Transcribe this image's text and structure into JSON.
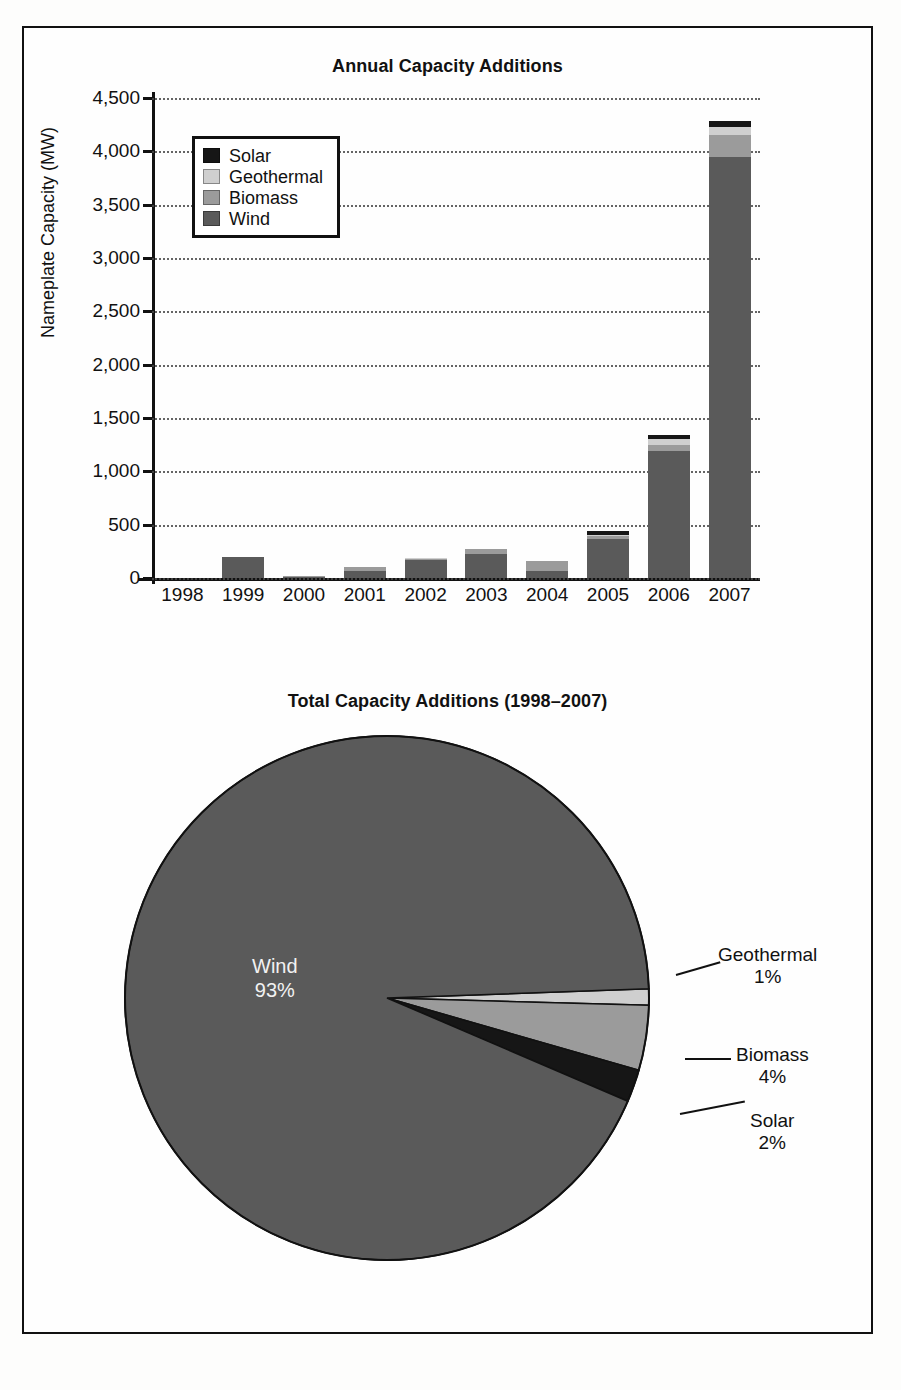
{
  "figure": {
    "background": "#fdfdfc",
    "border_color": "#111111"
  },
  "colors": {
    "solar": "#161616",
    "geothermal": "#cfcfcf",
    "biomass": "#9b9b9b",
    "wind": "#5a5a5a",
    "axis": "#111111",
    "grid": "#4a4a4a"
  },
  "bar_chart": {
    "title": "Annual Capacity Additions",
    "ylabel": "Nameplate Capacity (MW)",
    "legend": [
      {
        "label": "Solar",
        "color": "#161616"
      },
      {
        "label": "Geothermal",
        "color": "#cfcfcf"
      },
      {
        "label": "Biomass",
        "color": "#9b9b9b"
      },
      {
        "label": "Wind",
        "color": "#5a5a5a"
      }
    ],
    "yticks": [
      "4,500",
      "4,000",
      "3,500",
      "3,000",
      "2,500",
      "2,000",
      "1,500",
      "1,000",
      "500",
      "0"
    ]
  },
  "pie_chart": {
    "title": "Total Capacity Additions (1998–2007)",
    "callouts": [
      {
        "label": "Geothermal",
        "value": "1%"
      },
      {
        "label": "Biomass",
        "value": "4%"
      },
      {
        "label": "Solar",
        "value": "2%"
      },
      {
        "label": "Wind",
        "value": "93%"
      }
    ]
  },
  "chart_data": [
    {
      "type": "bar",
      "subtype": "stacked",
      "title": "Annual Capacity Additions",
      "xlabel": "",
      "ylabel": "Nameplate Capacity (MW)",
      "ylim": [
        0,
        4500
      ],
      "ytick_step": 500,
      "grid": true,
      "legend_position": "upper-left-inside",
      "categories": [
        "1998",
        "1999",
        "2000",
        "2001",
        "2002",
        "2003",
        "2004",
        "2005",
        "2006",
        "2007"
      ],
      "series": [
        {
          "name": "Wind",
          "color": "#5a5a5a",
          "values": [
            0,
            195,
            10,
            65,
            165,
            225,
            65,
            370,
            1190,
            3950
          ]
        },
        {
          "name": "Biomass",
          "color": "#9b9b9b",
          "values": [
            0,
            0,
            10,
            40,
            15,
            50,
            90,
            25,
            55,
            200
          ]
        },
        {
          "name": "Geothermal",
          "color": "#cfcfcf",
          "values": [
            0,
            0,
            0,
            0,
            5,
            0,
            0,
            10,
            55,
            80
          ]
        },
        {
          "name": "Solar",
          "color": "#161616",
          "values": [
            0,
            0,
            0,
            0,
            5,
            0,
            0,
            35,
            40,
            55
          ]
        }
      ],
      "totals": [
        0,
        195,
        20,
        105,
        190,
        275,
        155,
        440,
        1340,
        4285
      ]
    },
    {
      "type": "pie",
      "title": "Total Capacity Additions (1998–2007)",
      "labels": [
        "Wind",
        "Geothermal",
        "Biomass",
        "Solar"
      ],
      "values": [
        93,
        1,
        4,
        2
      ],
      "unit": "%",
      "colors": [
        "#5a5a5a",
        "#cfcfcf",
        "#9b9b9b",
        "#161616"
      ],
      "legend_position": "callout-labels"
    }
  ]
}
